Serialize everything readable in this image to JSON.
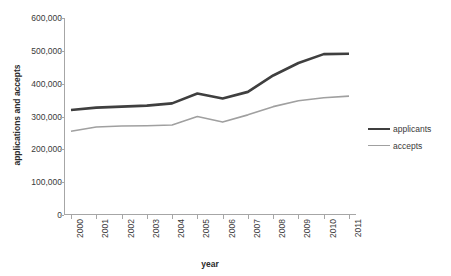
{
  "chart_data": {
    "type": "line",
    "title": "",
    "xlabel": "year",
    "ylabel": "applications and accepts",
    "categories": [
      "2000",
      "2001",
      "2002",
      "2003",
      "2004",
      "2005",
      "2006",
      "2007",
      "2008",
      "2009",
      "2010",
      "2011"
    ],
    "ylim": [
      0,
      600000
    ],
    "yticks": [
      0,
      100000,
      200000,
      300000,
      400000,
      500000,
      600000
    ],
    "ytick_labels": [
      "0",
      "100,000",
      "200,000",
      "300,000",
      "400,000",
      "500,000",
      "600,000"
    ],
    "grid": false,
    "legend_position": "right",
    "series": [
      {
        "name": "applicants",
        "color": "#3f3f3f",
        "width": 2.6,
        "values": [
          320000,
          327000,
          330000,
          333000,
          340000,
          370000,
          355000,
          375000,
          425000,
          463000,
          490000,
          491000
        ]
      },
      {
        "name": "accepts",
        "color": "#a0a0a0",
        "width": 1.6,
        "values": [
          255000,
          268000,
          271000,
          272000,
          274000,
          300000,
          283000,
          305000,
          330000,
          348000,
          357000,
          362000
        ]
      }
    ]
  },
  "legend": {
    "items": [
      {
        "label": "applicants"
      },
      {
        "label": "accepts"
      }
    ]
  },
  "axes": {
    "y_title": "applications and accepts",
    "x_title": "year"
  },
  "colors": {
    "applicants": "#3f3f3f",
    "accepts": "#a0a0a0",
    "axis": "#a6a6a6",
    "text": "#3a3a3a",
    "background": "#ffffff"
  }
}
